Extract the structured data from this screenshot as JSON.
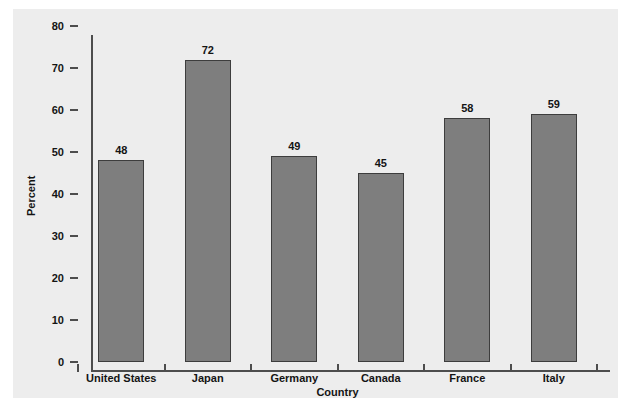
{
  "chart_data": {
    "type": "bar",
    "title": "",
    "subtitle": "",
    "xlabel": "Country",
    "ylabel": "Percent",
    "categories": [
      "United States",
      "Japan",
      "Germany",
      "Canada",
      "France",
      "Italy"
    ],
    "values": [
      48,
      72,
      49,
      45,
      58,
      59
    ],
    "value_labels": [
      "48",
      "72",
      "49",
      "45",
      "58",
      "59"
    ],
    "ylim": [
      0,
      80
    ],
    "ytick_values": [
      0,
      10,
      20,
      30,
      40,
      50,
      60,
      70,
      80
    ],
    "ytick_labels": [
      "0",
      "10",
      "20",
      "30",
      "40",
      "50",
      "60",
      "70",
      "80"
    ],
    "grid": false,
    "legend": false,
    "legend_position": "none",
    "bar_fill_color": "#7e7e7e",
    "bar_edge_color": "#3d3d3d",
    "panel_background_color": "#ededed",
    "page_background_color": "#ffffff",
    "axis_color": "#4d4d4d",
    "text_color": "#141414"
  },
  "caption": ""
}
